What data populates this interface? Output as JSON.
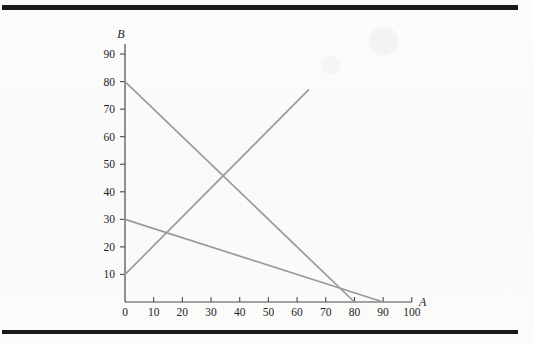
{
  "figure": {
    "background_color": "#fbfbfa",
    "rule_color": "#1a1a1a",
    "axis_color": "#4a4a4a",
    "line_color": "#9a9a9a"
  },
  "chart_data": {
    "type": "line",
    "title": "",
    "xlabel": "A",
    "ylabel": "B",
    "xlim": [
      0,
      100
    ],
    "ylim": [
      0,
      95
    ],
    "xticks": [
      0,
      10,
      20,
      30,
      40,
      50,
      60,
      70,
      80,
      90,
      100
    ],
    "yticks": [
      10,
      20,
      30,
      40,
      50,
      60,
      70,
      80,
      90
    ],
    "xtick_labels": [
      "0",
      "10",
      "20",
      "30",
      "40",
      "50",
      "60",
      "70",
      "80",
      "90",
      "100"
    ],
    "ytick_labels": [
      "10",
      "20",
      "30",
      "40",
      "50",
      "60",
      "70",
      "80",
      "90"
    ],
    "grid": false,
    "legend": false,
    "series": [
      {
        "name": "steep-descending-line",
        "color": "#9a9a9a",
        "x": [
          0,
          80
        ],
        "y": [
          80,
          0
        ],
        "intercepts": {
          "y_intercept": 80,
          "x_intercept": 80
        },
        "slope": -1
      },
      {
        "name": "shallow-descending-line",
        "color": "#9a9a9a",
        "x": [
          0,
          90
        ],
        "y": [
          30,
          0
        ],
        "intercepts": {
          "y_intercept": 30,
          "x_intercept": 90
        },
        "slope": -0.333
      },
      {
        "name": "ascending-line",
        "color": "#9a9a9a",
        "x": [
          0,
          64
        ],
        "y": [
          10,
          77
        ],
        "intercepts": {
          "y_intercept": 10
        },
        "slope": 1.047
      }
    ],
    "intersections": [
      {
        "label": "steep-vs-ascending",
        "x": 34,
        "y": 46
      },
      {
        "label": "shallow-vs-ascending",
        "x": 14,
        "y": 25
      },
      {
        "label": "steep-vs-shallow",
        "x": 75,
        "y": 5
      }
    ]
  }
}
